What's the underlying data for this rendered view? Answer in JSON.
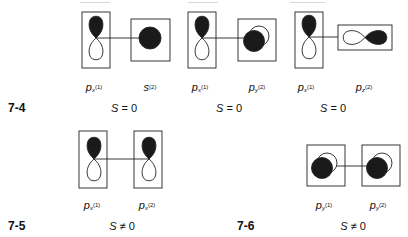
{
  "figures": [
    {
      "id": "7-4",
      "label": "7-4",
      "pairs": [
        {
          "orbital_1": {
            "symbol": "p",
            "subscript": "x",
            "superscript": "(1)"
          },
          "orbital_2": {
            "symbol": "s",
            "subscript": "",
            "superscript": "(2)"
          },
          "overlap": {
            "symbol": "S",
            "relation": "=",
            "value": "0"
          }
        },
        {
          "orbital_1": {
            "symbol": "p",
            "subscript": "x",
            "superscript": "(1)"
          },
          "orbital_2": {
            "symbol": "p",
            "subscript": "y",
            "superscript": "(2)"
          },
          "overlap": {
            "symbol": "S",
            "relation": "=",
            "value": "0"
          }
        },
        {
          "orbital_1": {
            "symbol": "p",
            "subscript": "x",
            "superscript": "(1)"
          },
          "orbital_2": {
            "symbol": "p",
            "subscript": "z",
            "superscript": "(2)"
          },
          "overlap": {
            "symbol": "S",
            "relation": "=",
            "value": "0"
          }
        }
      ]
    },
    {
      "id": "7-5",
      "label": "7-5",
      "pairs": [
        {
          "orbital_1": {
            "symbol": "p",
            "subscript": "x",
            "superscript": "(1)"
          },
          "orbital_2": {
            "symbol": "p",
            "subscript": "x",
            "superscript": "(2)"
          },
          "overlap": {
            "symbol": "S",
            "relation": "≠",
            "value": "0"
          }
        }
      ]
    },
    {
      "id": "7-6",
      "label": "7-6",
      "pairs": [
        {
          "orbital_1": {
            "symbol": "p",
            "subscript": "y",
            "superscript": "(1)"
          },
          "orbital_2": {
            "symbol": "p",
            "subscript": "y",
            "superscript": "(2)"
          },
          "overlap": {
            "symbol": "S",
            "relation": "≠",
            "value": "0"
          }
        }
      ]
    }
  ],
  "colors": {
    "lobe_filled": "#1a1a1a",
    "lobe_empty": "#ffffff",
    "stroke": "#222222",
    "background": "#ffffff"
  }
}
